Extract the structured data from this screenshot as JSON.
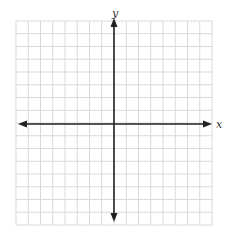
{
  "diagram": {
    "type": "coordinate-plane",
    "x_axis_label": "x",
    "y_axis_label": "y",
    "grid": {
      "columns": 16,
      "rows": 16,
      "left": 16,
      "top": 21,
      "right": 212,
      "bottom": 225,
      "line_color": "#d9d9d9"
    },
    "axes": {
      "color": "#222222",
      "origin_x": 114,
      "origin_y": 124,
      "x_axis_extent": [
        18,
        212
      ],
      "y_axis_extent": [
        18,
        222
      ],
      "arrows": "both-ends"
    }
  }
}
